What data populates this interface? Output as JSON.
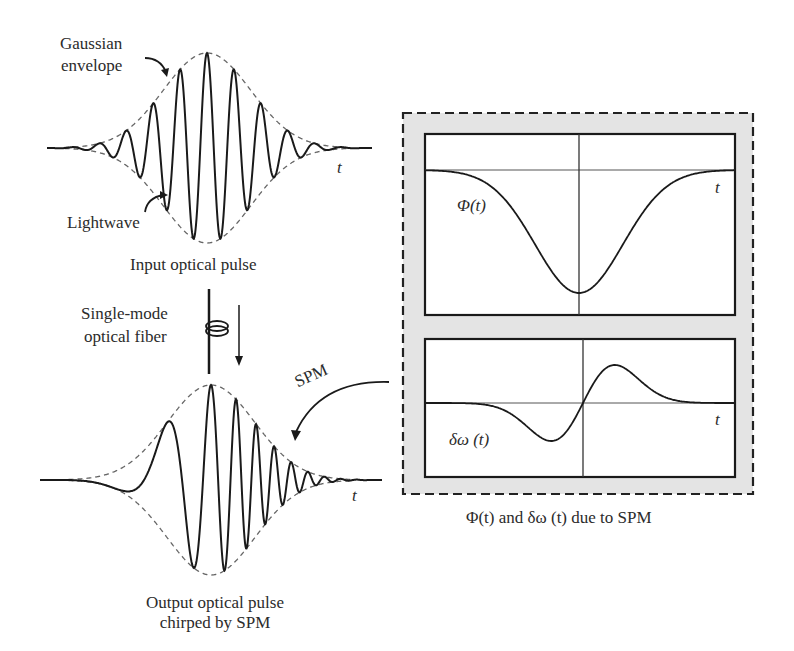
{
  "labels": {
    "gaussian_envelope_line1": "Gaussian",
    "gaussian_envelope_line2": "envelope",
    "lightwave": "Lightwave",
    "input_pulse": "Input optical pulse",
    "fiber_line1": "Single-mode",
    "fiber_line2": "optical fiber",
    "spm": "SPM",
    "output_line1": "Output optical pulse",
    "output_line2": "chirped by SPM",
    "t_symbol": "t",
    "phi_label": "Φ(t)",
    "domega_label": "δω (t)",
    "caption": "Φ(t) and δω (t) due to SPM"
  },
  "colors": {
    "stroke": "#1a1a1a",
    "dashed_envelope": "#666666",
    "panel_background": "#e4e4e4",
    "plot_background": "#ffffff",
    "axis": "#555555"
  },
  "input_pulse": {
    "baseline_y": 148,
    "x_start": 47,
    "x_end": 372,
    "center_x": 207,
    "amplitude": 95,
    "sigma": 62,
    "period": 27
  },
  "output_pulse": {
    "baseline_y": 480,
    "x_start": 40,
    "x_end": 382,
    "center_x": 211,
    "amplitude": 95,
    "sigma": 62,
    "chirp": "up-chirp (period decreasing with time)"
  },
  "phi_panel": {
    "x": 425,
    "y": 134,
    "w": 310,
    "h": 181,
    "axis_x": 579,
    "axis_y": 170,
    "min_y": 293
  },
  "domega_panel": {
    "x": 425,
    "y": 339,
    "w": 310,
    "h": 138,
    "axis_x": 583,
    "axis_y": 403,
    "peak_y": 366,
    "trough_y": 441
  },
  "outer_box": {
    "x": 403,
    "y": 113,
    "w": 350,
    "h": 381
  }
}
